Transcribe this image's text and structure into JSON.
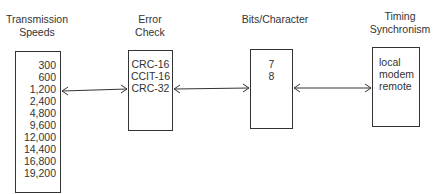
{
  "diagram": {
    "blocks": [
      {
        "heading": [
          "Transmission",
          "Speeds"
        ],
        "items": [
          "300",
          "600",
          "1,200",
          "2,400",
          "4,800",
          "9,600",
          "12,000",
          "14,400",
          "16,800",
          "19,200"
        ]
      },
      {
        "heading": [
          "Error",
          "Check"
        ],
        "items": [
          "CRC-16",
          "CCIT-16",
          "CRC-32"
        ]
      },
      {
        "heading": [
          "Bits/Character"
        ],
        "items": [
          "7",
          "8"
        ]
      },
      {
        "heading": [
          "Timing",
          "Synchronism"
        ],
        "items": [
          "local",
          "modem",
          "remote"
        ]
      }
    ],
    "connections": [
      {
        "from": "Transmission Speeds",
        "to": "Error Check",
        "type": "bidirectional-arrow"
      },
      {
        "from": "Error Check",
        "to": "Bits/Character",
        "type": "bidirectional-arrow"
      },
      {
        "from": "Bits/Character",
        "to": "Timing Synchronism",
        "type": "bidirectional-arrow"
      }
    ]
  }
}
